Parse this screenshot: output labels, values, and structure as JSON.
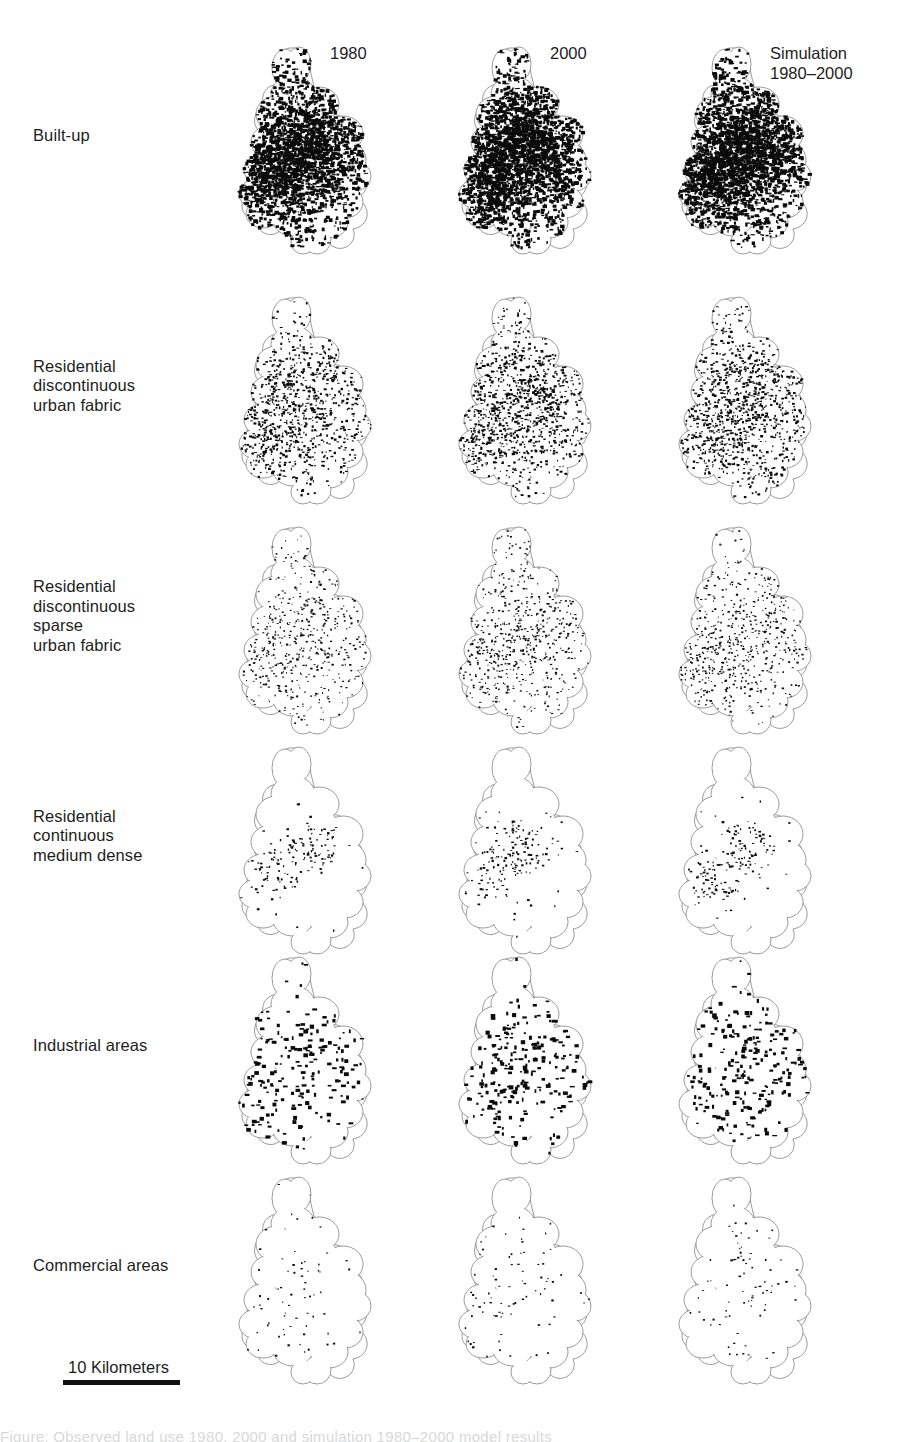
{
  "figure": {
    "type": "map-grid",
    "background_color": "#ffffff",
    "ink_color": "#0b0b0b",
    "outline_color": "#6e6e6e"
  },
  "columns": [
    {
      "id": "obs-1980",
      "lines": [
        "1980"
      ]
    },
    {
      "id": "obs-2000",
      "lines": [
        "2000"
      ]
    },
    {
      "id": "sim-1980-2000",
      "lines": [
        "Simulation",
        "1980–2000"
      ]
    }
  ],
  "rows": [
    {
      "id": "built-up",
      "lines": [
        "Built-up"
      ],
      "pattern": {
        "core": 0.95,
        "mid": 0.55,
        "outer": 0.22,
        "blob_min": 1.2,
        "blob_max": 4.6,
        "count": 2300,
        "corridor": 0.0
      }
    },
    {
      "id": "residential-discontinuous-urban-fabric",
      "lines": [
        "Residential",
        "discontinuous",
        "urban fabric"
      ],
      "pattern": {
        "core": 0.62,
        "mid": 0.42,
        "outer": 0.2,
        "blob_min": 1.0,
        "blob_max": 3.0,
        "count": 900,
        "corridor": 0.0
      }
    },
    {
      "id": "residential-discontinuous-sparse-urban-fabric",
      "lines": [
        "Residential",
        "discontinuous",
        "sparse",
        "urban fabric"
      ],
      "pattern": {
        "core": 0.45,
        "mid": 0.3,
        "outer": 0.16,
        "blob_min": 0.9,
        "blob_max": 2.4,
        "count": 520,
        "corridor": 0.0
      }
    },
    {
      "id": "residential-continuous-medium-dense",
      "lines": [
        "Residential",
        "continuous",
        "medium dense"
      ],
      "pattern": {
        "core": 0.95,
        "mid": 0.1,
        "outer": 0.02,
        "blob_min": 1.0,
        "blob_max": 2.8,
        "count": 150,
        "corridor": 0.0
      }
    },
    {
      "id": "industrial-areas",
      "lines": [
        "Industrial areas"
      ],
      "pattern": {
        "core": 0.55,
        "mid": 0.38,
        "outer": 0.18,
        "blob_min": 1.6,
        "blob_max": 5.0,
        "count": 200,
        "corridor": 0.0
      }
    },
    {
      "id": "commercial-areas",
      "lines": [
        "Commercial areas"
      ],
      "pattern": {
        "core": 0.3,
        "mid": 0.1,
        "outer": 0.05,
        "blob_min": 1.0,
        "blob_max": 2.6,
        "count": 70,
        "corridor": 0.72
      }
    }
  ],
  "scalebar": {
    "label": "10 Kilometers",
    "length_km": 10
  },
  "caption_strip": {
    "text": "Figure: Observed land use 1980, 2000 and simulation 1980–2000 model results"
  },
  "layout": {
    "column_x": [
      233,
      453,
      673
    ],
    "row_y": [
      42,
      292,
      522,
      742,
      952,
      1172
    ],
    "cell_width": 160,
    "cell_height": 232,
    "header_y": 44,
    "header_x": [
      330,
      550,
      770
    ]
  }
}
